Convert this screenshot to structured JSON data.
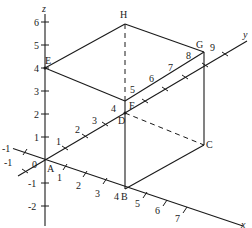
{
  "figure": {
    "type": "3D coordinate box diagram",
    "axes": {
      "x": {
        "label": "x",
        "ticks": [
          "-1",
          "1",
          "2",
          "3",
          "4",
          "5",
          "6",
          "7"
        ]
      },
      "y": {
        "label": "y",
        "ticks": [
          "-1",
          "1",
          "2",
          "3",
          "4",
          "5",
          "6",
          "7",
          "8",
          "9"
        ]
      },
      "z": {
        "label": "z",
        "ticks": [
          "6",
          "5",
          "4",
          "3",
          "2",
          "1",
          "-1",
          "-2"
        ]
      },
      "origin_label": "0"
    },
    "points": {
      "A": "A",
      "B": "B",
      "C": "C",
      "D": "D",
      "E": "E",
      "F": "F",
      "G": "G",
      "H": "H"
    },
    "labels": {
      "z6": "6",
      "z5": "5",
      "z4": "4",
      "z3": "3",
      "z2": "2",
      "z1": "1",
      "zm1": "-1",
      "zm2": "-2",
      "x1": "1",
      "x2": "2",
      "x3": "3",
      "x4": "4",
      "x5": "5",
      "x6": "6",
      "x7": "7",
      "xm1": "-1",
      "y1": "1",
      "y2": "2",
      "y3": "3",
      "y4": "4",
      "y5": "5",
      "y6": "6",
      "y7": "7",
      "y8": "8",
      "y9": "9",
      "ym1": "-1"
    }
  }
}
